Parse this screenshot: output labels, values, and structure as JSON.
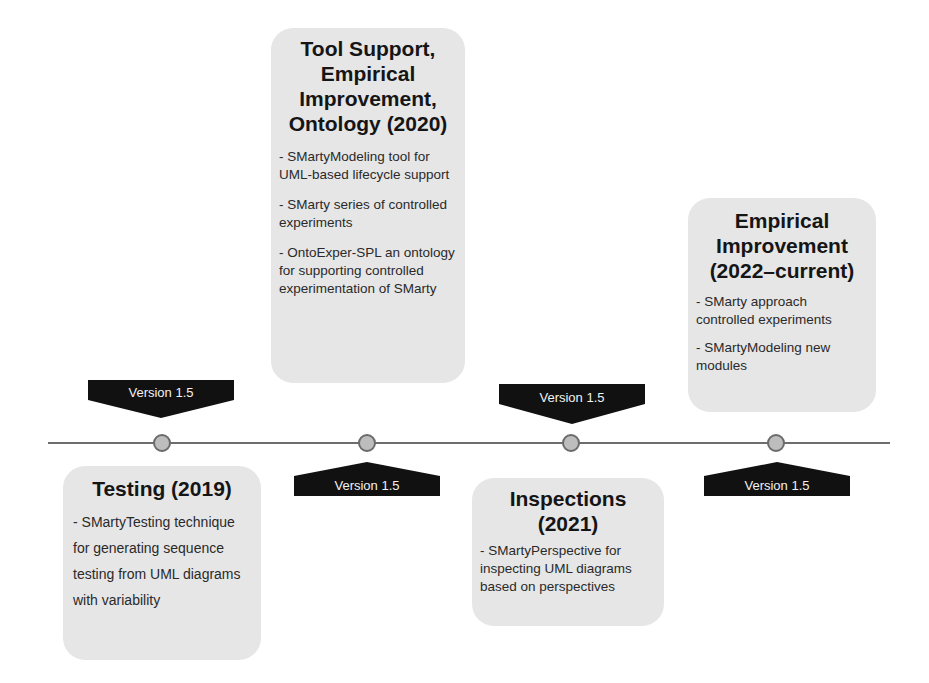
{
  "timeline": {
    "line_color": "#6d6d6d",
    "node_fill": "#bdbdbd",
    "tag_color": "#111111",
    "card_color": "#e6e6e6",
    "milestones": [
      {
        "title": "Testing (2019)",
        "version_tag": "Version 1.5",
        "items": [
          "- SMartyTesting technique for generating sequence testing from UML diagrams with variability"
        ]
      },
      {
        "title": "Tool Support, Empirical Improvement, Ontology (2020)",
        "version_tag": "Version 1.5",
        "items": [
          "- SMartyModeling tool for UML-based lifecycle support",
          "- SMarty series of controlled experiments",
          "- OntoExper-SPL an ontology for supporting controlled experimentation of SMarty"
        ]
      },
      {
        "title": "Inspections (2021)",
        "version_tag": "Version 1.5",
        "items": [
          "- SMartyPerspective for inspecting UML diagrams based on perspectives"
        ]
      },
      {
        "title": "Empirical Improvement (2022–current)",
        "version_tag": "Version 1.5",
        "items": [
          "- SMarty approach controlled experiments",
          "- SMartyModeling new modules"
        ]
      }
    ]
  }
}
